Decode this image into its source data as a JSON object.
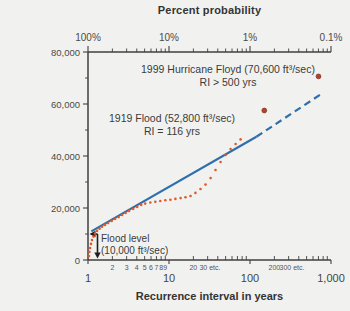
{
  "figure": {
    "background": "#f1f2ef"
  },
  "chart_data": {
    "type": "scatter",
    "title": "Percent probability",
    "x_axis": {
      "title": "Recurrence interval in years",
      "scale": "log",
      "range": [
        1,
        1000
      ],
      "major_ticks": [
        1,
        10,
        100,
        1000
      ],
      "major_labels": [
        "1",
        "10",
        "100",
        "1,000"
      ],
      "minor_tick_ris": [
        2,
        3,
        4,
        5,
        6,
        7,
        8,
        9,
        20,
        30,
        40,
        50,
        60,
        70,
        80,
        90,
        200,
        300,
        400,
        500,
        600,
        700,
        800,
        900
      ],
      "minor_labels": [
        {
          "ri": 2,
          "label": "2"
        },
        {
          "ri": 3,
          "label": "3"
        },
        {
          "ri": 4,
          "label": "4"
        },
        {
          "ri": 5,
          "label": "5"
        },
        {
          "ri": 6,
          "label": "6"
        },
        {
          "ri": 7,
          "label": "7"
        },
        {
          "ri": 8,
          "label": "8"
        },
        {
          "ri": 9,
          "label": "9"
        },
        {
          "ri": 20,
          "label": "20"
        },
        {
          "ri": 32,
          "label": "30 etc."
        },
        {
          "ri": 200,
          "label": "200"
        },
        {
          "ri": 330,
          "label": "300 etc."
        }
      ]
    },
    "top_axis": {
      "title_bound_note": "top axis shares log scale; probability = 1/RI",
      "labels": [
        {
          "ri": 1,
          "label": "100%"
        },
        {
          "ri": 10,
          "label": "10%"
        },
        {
          "ri": 100,
          "label": "1%"
        },
        {
          "ri": 1000,
          "label": "0.1%"
        }
      ]
    },
    "y_axis": {
      "title": "Maximum yearly discharge (ft³/sec)",
      "range": [
        0,
        80000
      ],
      "major_tick_step": 20000,
      "minor_tick_step": 10000,
      "major_labels": [
        {
          "q": 0,
          "label": "0"
        },
        {
          "q": 20000,
          "label": "20,000"
        },
        {
          "q": 40000,
          "label": "40,000"
        },
        {
          "q": 60000,
          "label": "60,000"
        },
        {
          "q": 80000,
          "label": "80,000"
        }
      ]
    },
    "trend_line": {
      "color": "#2f6fad",
      "solid": [
        [
          1.1,
          11000
        ],
        [
          120,
          47400
        ]
      ],
      "dashed": [
        [
          120,
          47400
        ],
        [
          730,
          63500
        ]
      ]
    },
    "scatter": {
      "color": "#de5a2c",
      "points": [
        [
          1.03,
          1500
        ],
        [
          1.04,
          3100
        ],
        [
          1.06,
          4600
        ],
        [
          1.09,
          6200
        ],
        [
          1.12,
          7700
        ],
        [
          1.17,
          9000
        ],
        [
          1.22,
          10200
        ],
        [
          1.29,
          11200
        ],
        [
          1.39,
          12000
        ],
        [
          1.49,
          12800
        ],
        [
          1.62,
          13500
        ],
        [
          1.77,
          14200
        ],
        [
          1.96,
          15000
        ],
        [
          2.16,
          15800
        ],
        [
          2.39,
          16500
        ],
        [
          2.64,
          17300
        ],
        [
          2.91,
          18100
        ],
        [
          3.22,
          18900
        ],
        [
          3.61,
          19600
        ],
        [
          4.05,
          20400
        ],
        [
          4.54,
          21200
        ],
        [
          5.08,
          21700
        ],
        [
          5.87,
          22100
        ],
        [
          6.77,
          22400
        ],
        [
          7.8,
          22700
        ],
        [
          9.0,
          23000
        ],
        [
          10.4,
          23200
        ],
        [
          12.0,
          23500
        ],
        [
          13.9,
          23800
        ],
        [
          16.0,
          24100
        ],
        [
          18.4,
          24600
        ],
        [
          21.2,
          25800
        ],
        [
          24.5,
          27300
        ],
        [
          28.2,
          29000
        ],
        [
          32.6,
          31500
        ],
        [
          37.5,
          34600
        ],
        [
          43.3,
          37700
        ],
        [
          50.0,
          40400
        ],
        [
          57.6,
          42700
        ],
        [
          66.4,
          44600
        ],
        [
          76.6,
          46400
        ]
      ]
    },
    "notable_points": [
      {
        "name": "flood-1919-point",
        "ri": 150,
        "q": 57500,
        "color": "#b0432f"
      },
      {
        "name": "hurricane-floyd-point",
        "ri": 700,
        "q": 70600,
        "color": "#b0432f"
      }
    ],
    "flood_level_marker": {
      "q": 10000
    },
    "annotations": {
      "floyd": {
        "line1": "1999 Hurricane Floyd (70,600 ft³/sec)",
        "line2": "RI > 500 yrs"
      },
      "flood_1919": {
        "line1": "1919 Flood (52,800 ft³/sec)",
        "line2": "RI = 116 yrs"
      },
      "flood_level": {
        "line1": "Flood level",
        "line2": "(10,000 ft³/sec)"
      }
    },
    "layout": {
      "grid": false,
      "legend": "none"
    }
  }
}
